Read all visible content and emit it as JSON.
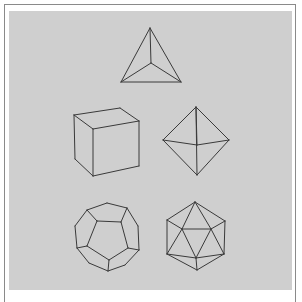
{
  "figure": {
    "colors": {
      "background": "#ffffff",
      "frame": "#8a8a8a",
      "panel": "#cfcfcf",
      "stroke": "#3a3a3a"
    },
    "solids": [
      {
        "name": "tetrahedron",
        "edges": [
          [
            [
              150,
              28
            ],
            [
              121,
              82
            ]
          ],
          [
            [
              150,
              28
            ],
            [
              181,
              82
            ]
          ],
          [
            [
              121,
              82
            ],
            [
              181,
              82
            ]
          ],
          [
            [
              150,
              28
            ],
            [
              151,
              63
            ]
          ],
          [
            [
              151,
              63
            ],
            [
              121,
              82
            ]
          ],
          [
            [
              151,
              63
            ],
            [
              181,
              82
            ]
          ]
        ]
      },
      {
        "name": "cube",
        "edges": [
          [
            [
              74,
              115
            ],
            [
              120,
              108
            ]
          ],
          [
            [
              120,
              108
            ],
            [
              139,
              121
            ]
          ],
          [
            [
              139,
              121
            ],
            [
              93,
              129
            ]
          ],
          [
            [
              93,
              129
            ],
            [
              74,
              115
            ]
          ],
          [
            [
              74,
              115
            ],
            [
              75,
              159
            ]
          ],
          [
            [
              93,
              129
            ],
            [
              93,
              176
            ]
          ],
          [
            [
              139,
              121
            ],
            [
              139,
              166
            ]
          ],
          [
            [
              75,
              159
            ],
            [
              93,
              176
            ]
          ],
          [
            [
              93,
              176
            ],
            [
              139,
              166
            ]
          ]
        ]
      },
      {
        "name": "octahedron",
        "edges": [
          [
            [
              196,
              107
            ],
            [
              163,
              140
            ]
          ],
          [
            [
              196,
              107
            ],
            [
              229,
              140
            ]
          ],
          [
            [
              196,
              107
            ],
            [
              197,
              145
            ]
          ],
          [
            [
              196,
              107
            ],
            [
              197,
              175
            ]
          ],
          [
            [
              163,
              140
            ],
            [
              197,
              145
            ]
          ],
          [
            [
              197,
              145
            ],
            [
              229,
              140
            ]
          ],
          [
            [
              163,
              140
            ],
            [
              197,
              175
            ]
          ],
          [
            [
              229,
              140
            ],
            [
              197,
              175
            ]
          ]
        ]
      },
      {
        "name": "dodecahedron",
        "edges": [
          [
            [
              87,
              210
            ],
            [
              107,
              203
            ]
          ],
          [
            [
              107,
              203
            ],
            [
              127,
              208
            ]
          ],
          [
            [
              127,
              208
            ],
            [
              138,
              226
            ]
          ],
          [
            [
              138,
              226
            ],
            [
              139,
              250
            ]
          ],
          [
            [
              139,
              250
            ],
            [
              125,
              265
            ]
          ],
          [
            [
              125,
              265
            ],
            [
              108,
              271
            ]
          ],
          [
            [
              108,
              271
            ],
            [
              89,
              263
            ]
          ],
          [
            [
              89,
              263
            ],
            [
              77,
              248
            ]
          ],
          [
            [
              77,
              248
            ],
            [
              75,
              226
            ]
          ],
          [
            [
              75,
              226
            ],
            [
              87,
              210
            ]
          ],
          [
            [
              97,
              221
            ],
            [
              121,
              222
            ]
          ],
          [
            [
              121,
              222
            ],
            [
              128,
              248
            ]
          ],
          [
            [
              128,
              248
            ],
            [
              109,
              260
            ]
          ],
          [
            [
              109,
              260
            ],
            [
              87,
              246
            ]
          ],
          [
            [
              87,
              246
            ],
            [
              97,
              221
            ]
          ],
          [
            [
              97,
              221
            ],
            [
              87,
              210
            ]
          ],
          [
            [
              121,
              222
            ],
            [
              127,
              208
            ]
          ],
          [
            [
              128,
              248
            ],
            [
              139,
              250
            ]
          ],
          [
            [
              109,
              260
            ],
            [
              108,
              271
            ]
          ],
          [
            [
              87,
              246
            ],
            [
              77,
              248
            ]
          ]
        ]
      },
      {
        "name": "icosahedron",
        "edges": [
          [
            [
              195,
              202
            ],
            [
              167,
              220
            ]
          ],
          [
            [
              195,
              202
            ],
            [
              225,
              221
            ]
          ],
          [
            [
              167,
              220
            ],
            [
              167,
              254
            ]
          ],
          [
            [
              225,
              221
            ],
            [
              224,
              254
            ]
          ],
          [
            [
              167,
              254
            ],
            [
              197,
              270
            ]
          ],
          [
            [
              224,
              254
            ],
            [
              197,
              270
            ]
          ],
          [
            [
              195,
              202
            ],
            [
              182,
              229
            ]
          ],
          [
            [
              195,
              202
            ],
            [
              211,
              229
            ]
          ],
          [
            [
              182,
              229
            ],
            [
              211,
              229
            ]
          ],
          [
            [
              182,
              229
            ],
            [
              196,
              258
            ]
          ],
          [
            [
              211,
              229
            ],
            [
              196,
              258
            ]
          ],
          [
            [
              167,
              220
            ],
            [
              182,
              229
            ]
          ],
          [
            [
              225,
              221
            ],
            [
              211,
              229
            ]
          ],
          [
            [
              167,
              254
            ],
            [
              182,
              229
            ]
          ],
          [
            [
              224,
              254
            ],
            [
              211,
              229
            ]
          ],
          [
            [
              167,
              254
            ],
            [
              196,
              258
            ]
          ],
          [
            [
              224,
              254
            ],
            [
              196,
              258
            ]
          ],
          [
            [
              196,
              258
            ],
            [
              197,
              270
            ]
          ]
        ]
      }
    ]
  }
}
